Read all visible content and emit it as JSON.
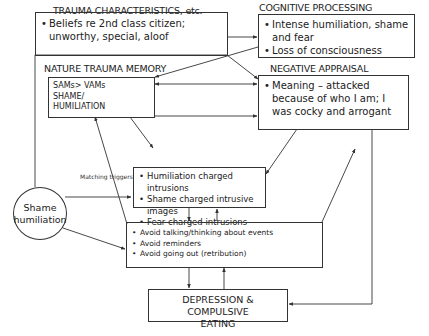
{
  "diagram": {
    "nodes": {
      "trauma_characteristics": {
        "title": "TRAUMA CHARACTERISTICS, etc.",
        "items": [
          "Beliefs re 2nd class citizen; unworthy, special, aloof"
        ]
      },
      "cognitive_processing": {
        "title": "COGNITIVE PROCESSING",
        "items": [
          "Intense humiliation, shame and fear",
          "Loss of consciousness"
        ]
      },
      "nature_trauma_memory": {
        "title": "NATURE TRAUMA MEMORY",
        "lines": [
          "SAMs> VAMs",
          "SHAME/",
          "HUMILIATION"
        ]
      },
      "negative_appraisal": {
        "title": "NEGATIVE APPRAISAL",
        "items": [
          "Meaning – attacked because of who I am;  I was cocky and arrogant"
        ]
      },
      "intrusions": {
        "items": [
          "Humiliation charged intrusions",
          "Shame charged intrusive images",
          "Fear charged intrusions"
        ]
      },
      "avoidance": {
        "items": [
          "Avoid talking/thinking about events",
          "Avoid reminders",
          "Avoid going out (retribution)"
        ]
      },
      "depression": {
        "lines": [
          "DEPRESSION  & COMPULSIVE",
          "EATING"
        ]
      },
      "shame_humiliation": {
        "lines": [
          "Shame",
          "humiliation"
        ]
      }
    },
    "edge_labels": {
      "matching_triggers": "Matching triggers"
    },
    "edges": [
      {
        "from": "trauma_characteristics",
        "to": "cognitive_processing"
      },
      {
        "from": "trauma_characteristics",
        "to": "negative_appraisal"
      },
      {
        "from": "cognitive_processing",
        "to": "nature_trauma_memory"
      },
      {
        "from": "nature_trauma_memory",
        "to": "negative_appraisal",
        "bidirectional": true
      },
      {
        "from": "nature_trauma_memory",
        "to": "negative_appraisal"
      },
      {
        "from": "nature_trauma_memory",
        "to": "intrusions"
      },
      {
        "from": "negative_appraisal",
        "to": "intrusions"
      },
      {
        "from": "avoidance",
        "to": "nature_trauma_memory",
        "label": "Matching triggers"
      },
      {
        "from": "shame_humiliation",
        "to": "intrusions"
      },
      {
        "from": "shame_humiliation",
        "to": "avoidance"
      },
      {
        "from": "intrusions",
        "to": "avoidance"
      },
      {
        "from": "avoidance",
        "to": "intrusions"
      },
      {
        "from": "avoidance",
        "to": "negative_appraisal"
      },
      {
        "from": "avoidance",
        "to": "depression"
      },
      {
        "from": "depression",
        "to": "avoidance"
      },
      {
        "from": "negative_appraisal",
        "to": "depression"
      }
    ],
    "colors": {
      "line": "#333333",
      "text": "#222222",
      "background": "#ffffff"
    }
  }
}
